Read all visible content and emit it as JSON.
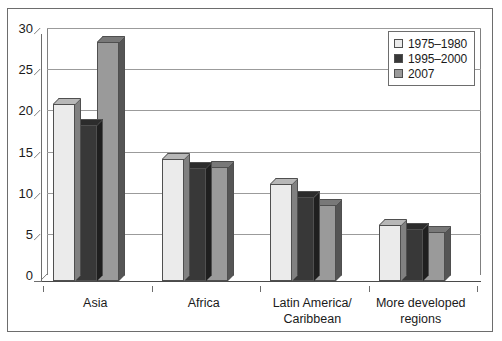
{
  "chart_data": {
    "type": "bar",
    "title": "",
    "subtitle": "",
    "xlabel": "",
    "ylabel": "",
    "categories": [
      "Asia",
      "Africa",
      "Latin America/\nCaribbean",
      "More developed\nregions"
    ],
    "series": [
      {
        "name": "1975–1980",
        "color": "#ebebeb",
        "values": [
          21.5,
          14.8,
          11.8,
          6.8
        ]
      },
      {
        "name": "1995–2000",
        "color": "#383838",
        "values": [
          19.0,
          13.7,
          10.2,
          6.3
        ]
      },
      {
        "name": "2007",
        "color": "#9a9a9a",
        "values": [
          29.0,
          13.8,
          9.2,
          5.9
        ]
      }
    ],
    "ylim": [
      0,
      30
    ],
    "yticks": [
      0,
      5,
      10,
      15,
      20,
      25,
      30
    ],
    "ytick_labels": [
      "0",
      "5",
      "10",
      "15",
      "20",
      "25",
      "30"
    ],
    "grid": true,
    "legend_position": "top-right",
    "style": "3d-column",
    "axis_color": "#6d6d6d",
    "grid_color": "#9b9b9b",
    "bar_edge_color": "#4f4f4f",
    "background": "#ffffff"
  },
  "categories_display": [
    {
      "line1": "Asia",
      "line2": ""
    },
    {
      "line1": "Africa",
      "line2": ""
    },
    {
      "line1": "Latin America/",
      "line2": "Caribbean"
    },
    {
      "line1": "More developed",
      "line2": "regions"
    }
  ],
  "legend": {
    "items": [
      {
        "label": "1975–1980"
      },
      {
        "label": "1995–2000"
      },
      {
        "label": "2007"
      }
    ]
  }
}
